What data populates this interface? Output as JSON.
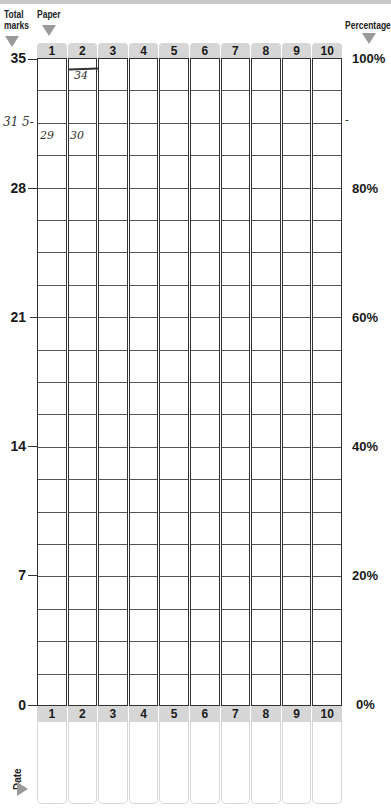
{
  "header": {
    "total_marks_label": "Total marks",
    "paper_label": "Paper",
    "percentage_label": "Percentage",
    "date_label": "Date"
  },
  "papers": [
    "1",
    "2",
    "3",
    "4",
    "5",
    "6",
    "7",
    "8",
    "9",
    "10"
  ],
  "left_axis": [
    "35",
    "28",
    "21",
    "14",
    "7",
    "0"
  ],
  "right_axis": [
    "100%",
    "80%",
    "60%",
    "40%",
    "20%",
    "0%"
  ],
  "handwritten": {
    "target_mark": "31.5",
    "target_mark_display": "31 5-",
    "paper1_score": "29",
    "paper2_score": "30",
    "paper2_top_note": "34",
    "right_dash": "-"
  },
  "chart_data": {
    "type": "table",
    "xlabel": "Paper",
    "ylabel": "Total marks",
    "y2label": "Percentage",
    "categories": [
      "1",
      "2",
      "3",
      "4",
      "5",
      "6",
      "7",
      "8",
      "9",
      "10"
    ],
    "ylim": [
      0,
      35
    ],
    "y_ticks": [
      0,
      7,
      14,
      21,
      28,
      35
    ],
    "y2_ticks": [
      "0%",
      "20%",
      "40%",
      "60%",
      "80%",
      "100%"
    ],
    "rows_per_column": 20,
    "grid": true,
    "annotations": [
      {
        "text": "31.5",
        "position": "left axis, target line"
      },
      {
        "text": "29",
        "paper": "1"
      },
      {
        "text": "30",
        "paper": "2"
      },
      {
        "text": "34",
        "paper": "2",
        "position": "top"
      }
    ],
    "series": [
      {
        "name": "Handwritten scores",
        "values": [
          29,
          30,
          null,
          null,
          null,
          null,
          null,
          null,
          null,
          null
        ]
      }
    ]
  }
}
